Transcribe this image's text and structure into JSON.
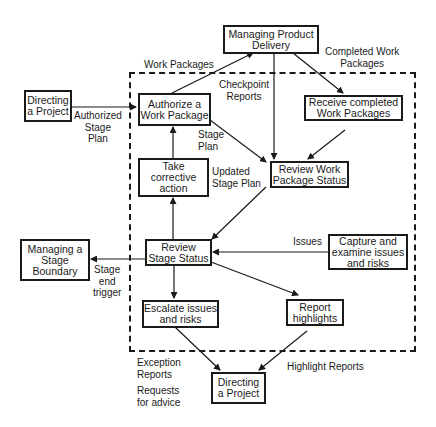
{
  "diagram": {
    "nodes": {
      "managing_product_delivery": "Managing Product\nDelivery",
      "directing_project_top": "Directing\na Project",
      "authorize_work_package": "Authorize a\nWork Package",
      "receive_completed": "Receive completed\nWork Packages",
      "take_corrective": "Take\ncorrective\naction",
      "review_work_package": "Review Work\nPackage Status",
      "managing_stage_boundary": "Managing a\nStage\nBoundary",
      "review_stage_status": "Review\nStage Status",
      "capture_issues": "Capture and\nexamine issues\nand risks",
      "escalate_issues": "Escalate issues\nand risks",
      "report_highlights": "Report\nhighlights",
      "directing_project_bottom": "Directing\na Project"
    },
    "edge_labels": {
      "work_packages": "Work Packages",
      "completed_work_packages": "Completed Work\nPackages",
      "checkpoint_reports": "Checkpoint\nReports",
      "authorized_stage_plan": "Authorized\nStage\nPlan",
      "stage_plan": "Stage\nPlan",
      "updated_stage_plan": "Updated\nStage Plan",
      "issues": "Issues",
      "stage_end_trigger": "Stage\nend\ntrigger",
      "exception_reports": "Exception\nReports",
      "requests_for_advice": "Requests\nfor advice",
      "highlight_reports": "Highlight Reports"
    },
    "colors": {
      "line": "#1a1a1a",
      "background": "#ffffff"
    }
  }
}
